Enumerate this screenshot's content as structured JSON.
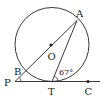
{
  "diagram": {
    "type": "circle-tangent-secant",
    "labels": {
      "A": "A",
      "O": "O",
      "B": "B",
      "P": "P",
      "T": "T",
      "C": "C",
      "angle": "67°"
    },
    "colors": {
      "stroke": "#222222",
      "background": "#ffffff"
    }
  }
}
